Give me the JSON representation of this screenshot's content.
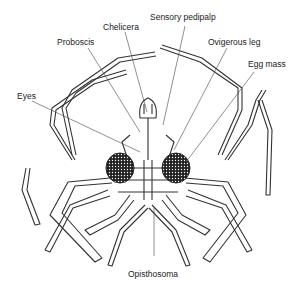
{
  "figure": {
    "labels": {
      "sensory_pedipalp": "Sensory pedipalp",
      "chelicera": "Chelicera",
      "proboscis": "Proboscis",
      "ovigerous_leg": "Ovigerous leg",
      "egg_mass": "Egg mass",
      "eyes": "Eyes",
      "opisthosoma": "Opisthosoma"
    }
  }
}
